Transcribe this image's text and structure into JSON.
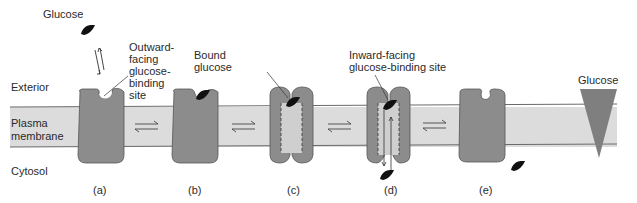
{
  "labels": {
    "glucose_top": "Glucose",
    "outward_site": [
      "Outward-",
      "facing",
      "glucose-",
      "binding",
      "site"
    ],
    "bound_glucose": [
      "Bound",
      "glucose"
    ],
    "inward_site": [
      "Inward-facing",
      "glucose-binding site"
    ],
    "glucose_gradient": "Glucose",
    "exterior": "Exterior",
    "plasma_membrane": [
      "Plasma",
      "membrane"
    ],
    "cytosol": "Cytosol"
  },
  "stages": [
    {
      "id": "a",
      "label": "(a)"
    },
    {
      "id": "b",
      "label": "(b)"
    },
    {
      "id": "c",
      "label": "(c)"
    },
    {
      "id": "d",
      "label": "(d)"
    },
    {
      "id": "e",
      "label": "(e)"
    }
  ],
  "colors": {
    "membrane": "#dcdcdc",
    "membrane_line": "#6a6a6a",
    "protein": "#8c8c8c",
    "protein_outline": "#555555",
    "glucose": "#111111",
    "gradient": "#7f7f7f"
  }
}
